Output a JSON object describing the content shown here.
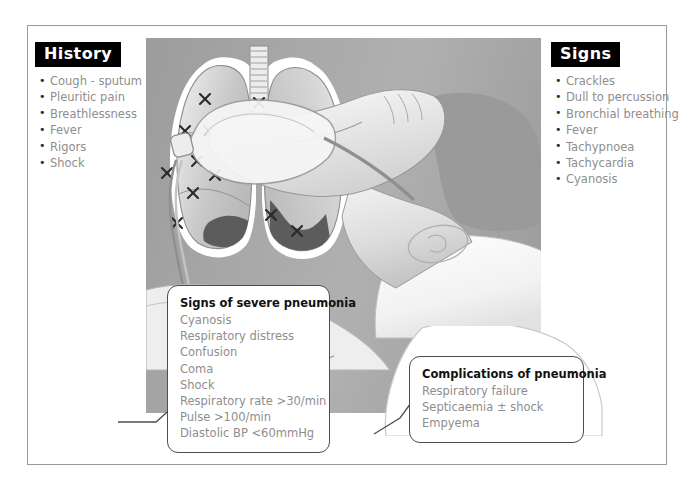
{
  "figure": {
    "frame_color": "#9b9b9b",
    "panel_color": "#a6a6a6",
    "chip_bg": "#000000",
    "chip_text": "#ffffff",
    "body_text_color": "#8e8e8e",
    "heading_text_color": "#111111"
  },
  "history": {
    "heading": "History",
    "items": [
      "Cough - sputum",
      "Pleuritic pain",
      "Breathlessness",
      "Fever",
      "Rigors",
      "Shock"
    ]
  },
  "signs": {
    "heading": "Signs",
    "items": [
      "Crackles",
      "Dull to percussion",
      "Bronchial breathing",
      "Fever",
      "Tachypnoea",
      "Tachycardia",
      "Cyanosis"
    ]
  },
  "severe": {
    "title": "Signs of severe pneumonia",
    "items": [
      "Cyanosis",
      "Respiratory distress",
      "Confusion",
      "Coma",
      "Shock",
      "Respiratory rate >30/min",
      "Pulse >100/min",
      "Diastolic BP <60mmHg"
    ]
  },
  "complications": {
    "title": "Complications of pneumonia",
    "items": [
      "Respiratory failure",
      "Septicaemia ± shock",
      "Empyema"
    ]
  },
  "illustration": {
    "scene_name": "lungs-and-patient-with-oxygen-mask",
    "lungs_label": "lungs-diagram",
    "trachea_label": "trachea",
    "consolidation_label": "consolidation-shading",
    "crosses_label": "crackles-crosses",
    "patient_label": "patient-head-profile",
    "mask_label": "oxygen-mask",
    "tubing_label": "oxygen-tubing",
    "pillow_label": "pillow",
    "cross_count": 17,
    "cross_marker": "✕"
  }
}
